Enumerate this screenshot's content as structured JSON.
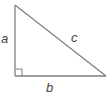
{
  "diagram": {
    "type": "right-triangle",
    "stroke_color": "#808080",
    "label_color": "#444444",
    "background": "#ffffff",
    "vertices": {
      "top": [
        15,
        5
      ],
      "right_angle": [
        15,
        76
      ],
      "right": [
        106,
        76
      ]
    },
    "right_angle_marker_size": 7,
    "labels": {
      "a": "a",
      "b": "b",
      "c": "c"
    },
    "sides": [
      {
        "name": "a",
        "description": "vertical leg"
      },
      {
        "name": "b",
        "description": "horizontal leg"
      },
      {
        "name": "c",
        "description": "hypotenuse"
      }
    ]
  }
}
